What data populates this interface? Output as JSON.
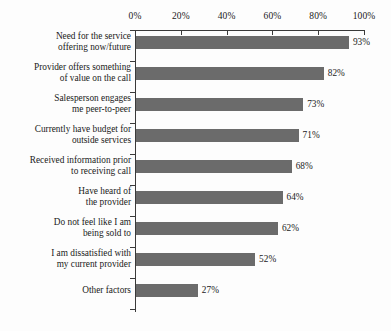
{
  "chart_data": {
    "type": "bar",
    "orientation": "horizontal",
    "title": "",
    "xlabel": "",
    "ylabel": "",
    "xlim": [
      0,
      100
    ],
    "grid": false,
    "legend": null,
    "bar_color": "#6b6b6b",
    "axis_color": "#3a3a3a",
    "background_color": "#fdfdfd",
    "value_suffix": "%",
    "xticks": [
      0,
      20,
      40,
      60,
      80,
      100
    ],
    "xtick_labels": [
      "0%",
      "20%",
      "40%",
      "60%",
      "80%",
      "100%"
    ],
    "categories": [
      "Need for the service\noffering now/future",
      "Provider offers something\nof value on the call",
      "Salesperson engages\nme peer-to-peer",
      "Currently have budget for\noutside services",
      "Received information prior\nto receiving call",
      "Have heard of\nthe provider",
      "Do not feel like I am\nbeing sold to",
      "I am dissatisfied with\nmy current provider",
      "Other factors"
    ],
    "values": [
      93,
      82,
      73,
      71,
      68,
      64,
      62,
      52,
      27
    ],
    "value_labels": [
      "93%",
      "82%",
      "73%",
      "71%",
      "68%",
      "64%",
      "62%",
      "52%",
      "27%"
    ]
  }
}
